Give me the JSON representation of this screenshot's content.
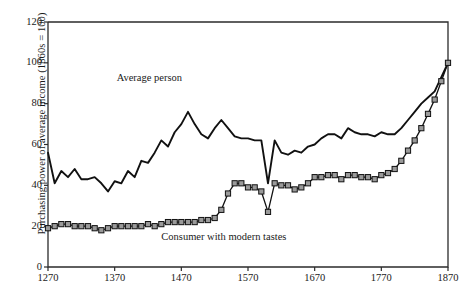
{
  "chart_data": {
    "type": "line",
    "title": "",
    "xlabel": "",
    "ylabel": "Purchasing power of average income (1860s = 100)",
    "xlim": [
      1270,
      1870
    ],
    "ylim": [
      0,
      120
    ],
    "xticks": [
      1270,
      1370,
      1470,
      1570,
      1670,
      1770,
      1870
    ],
    "ytick_labels": [
      "0",
      "20",
      "40",
      "60",
      "80",
      "100",
      "120"
    ],
    "yticks": [
      0,
      20,
      40,
      60,
      80,
      100,
      120
    ],
    "grid": false,
    "legend": "inline-annotations",
    "annotations": [
      {
        "text": "Average person",
        "x": 1430,
        "y": 92
      },
      {
        "text": "Consumer with modern tastes",
        "x": 1545,
        "y": 14
      }
    ],
    "series": [
      {
        "name": "Average person",
        "marker": "none",
        "color": "#111111",
        "x": [
          1270,
          1280,
          1290,
          1300,
          1310,
          1320,
          1330,
          1340,
          1350,
          1360,
          1370,
          1380,
          1390,
          1400,
          1410,
          1420,
          1430,
          1440,
          1450,
          1460,
          1470,
          1480,
          1490,
          1500,
          1510,
          1520,
          1530,
          1540,
          1550,
          1560,
          1570,
          1580,
          1590,
          1600,
          1610,
          1620,
          1630,
          1640,
          1650,
          1660,
          1670,
          1680,
          1690,
          1700,
          1710,
          1720,
          1730,
          1740,
          1750,
          1760,
          1770,
          1780,
          1790,
          1800,
          1810,
          1820,
          1830,
          1840,
          1850,
          1860,
          1870
        ],
        "values": [
          56,
          41,
          47,
          44,
          48,
          43,
          43,
          44,
          41,
          37,
          42,
          41,
          47,
          44,
          52,
          51,
          56,
          62,
          59,
          66,
          70,
          76,
          70,
          65,
          63,
          68,
          72,
          68,
          64,
          63,
          63,
          62,
          62,
          41,
          62,
          56,
          55,
          57,
          56,
          59,
          60,
          63,
          65,
          65,
          63,
          68,
          66,
          65,
          65,
          64,
          66,
          65,
          65,
          68,
          72,
          76,
          80,
          83,
          86,
          93,
          100
        ]
      },
      {
        "name": "Consumer with modern tastes",
        "marker": "square",
        "color": "#111111",
        "marker_fill": "#9a9a9a",
        "x": [
          1270,
          1280,
          1290,
          1300,
          1310,
          1320,
          1330,
          1340,
          1350,
          1360,
          1370,
          1380,
          1390,
          1400,
          1410,
          1420,
          1430,
          1440,
          1450,
          1460,
          1470,
          1480,
          1490,
          1500,
          1510,
          1520,
          1530,
          1540,
          1550,
          1560,
          1570,
          1580,
          1590,
          1600,
          1610,
          1620,
          1630,
          1640,
          1650,
          1660,
          1670,
          1680,
          1690,
          1700,
          1710,
          1720,
          1730,
          1740,
          1750,
          1760,
          1770,
          1780,
          1790,
          1800,
          1810,
          1820,
          1830,
          1840,
          1850,
          1860,
          1870
        ],
        "values": [
          19,
          20,
          21,
          21,
          20,
          20,
          20,
          19,
          18,
          19,
          20,
          20,
          20,
          20,
          20,
          21,
          20,
          21,
          22,
          22,
          22,
          22,
          22,
          23,
          23,
          24,
          28,
          36,
          41,
          41,
          39,
          39,
          37,
          27,
          41,
          40,
          40,
          38,
          39,
          41,
          44,
          44,
          45,
          45,
          43,
          45,
          45,
          44,
          44,
          43,
          45,
          46,
          48,
          52,
          57,
          62,
          68,
          75,
          82,
          91,
          100
        ]
      }
    ]
  }
}
